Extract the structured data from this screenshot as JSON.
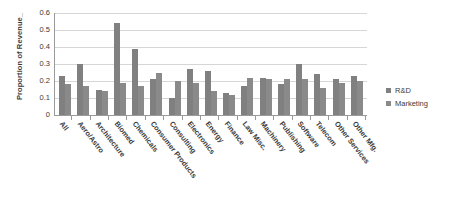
{
  "chart_data": {
    "type": "bar",
    "title": "",
    "xlabel": "",
    "ylabel": "Proportion of Revenue_",
    "ylim": [
      0,
      0.6
    ],
    "yticks": [
      "0.6",
      "0.5",
      "0.4",
      "0.3",
      "0.2",
      "0.1",
      "0"
    ],
    "ytick_values": [
      0.6,
      0.5,
      0.4,
      0.3,
      0.2,
      0.1,
      0
    ],
    "grid": true,
    "legend_position": "right",
    "categories": [
      "All",
      "Aero/Astro",
      "Architecture",
      "Biomed",
      "Chemicals",
      "Consumer Products",
      "Consulting",
      "Electronics",
      "Energy",
      "Finance",
      "Law Misc.",
      "Machinery",
      "Publishing",
      "Software",
      "Telecom",
      "Other Services",
      "Other Mfg."
    ],
    "series": [
      {
        "name": "R&D",
        "color": "#808080",
        "values": [
          0.23,
          0.3,
          0.15,
          0.54,
          0.39,
          0.21,
          0.1,
          0.27,
          0.26,
          0.13,
          0.17,
          0.22,
          0.18,
          0.3,
          0.24,
          0.21,
          0.23
        ]
      },
      {
        "name": "Marketing",
        "color": "#8a8a8a",
        "values": [
          0.18,
          0.17,
          0.14,
          0.19,
          0.17,
          0.25,
          0.2,
          0.19,
          0.14,
          0.12,
          0.22,
          0.21,
          0.21,
          0.21,
          0.16,
          0.19,
          0.2
        ]
      }
    ]
  }
}
